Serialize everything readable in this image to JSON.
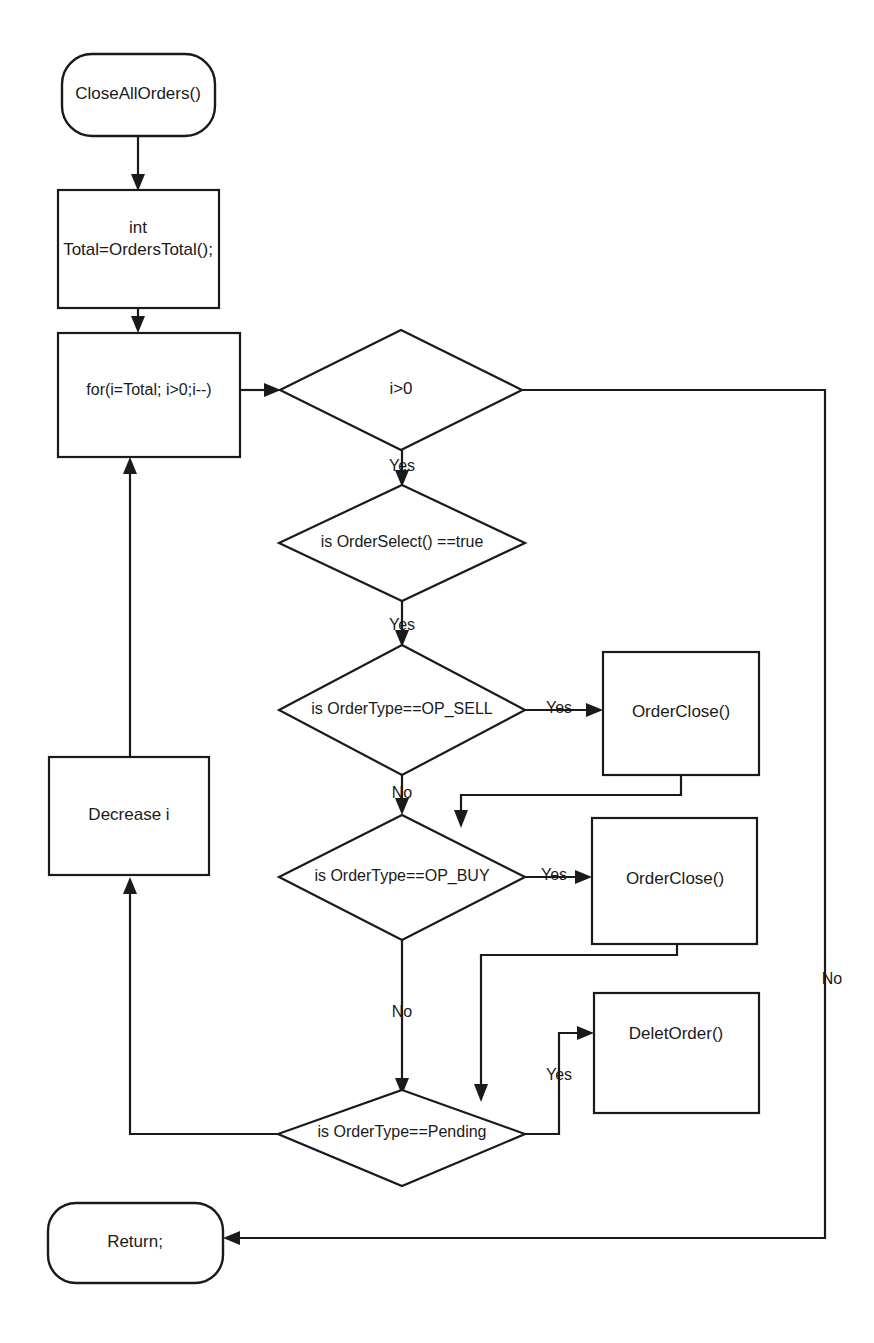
{
  "diagram": {
    "type": "flowchart",
    "background_color": "#ffffff",
    "line_color": "#1a1a1a",
    "text_color": "#1a1a1a"
  },
  "nodes": {
    "start": {
      "label": "CloseAllOrders()",
      "shape": "terminator"
    },
    "init_total": {
      "line1": "int",
      "line2": "Total=OrdersTotal();",
      "shape": "process"
    },
    "for_loop": {
      "label": "for(i=Total; i>0;i--)",
      "shape": "process"
    },
    "cond_i_gt_0": {
      "label": "i>0",
      "shape": "decision"
    },
    "cond_order_select": {
      "label": "is OrderSelect() ==true",
      "shape": "decision"
    },
    "cond_op_sell": {
      "label": "is OrderType==OP_SELL",
      "shape": "decision"
    },
    "cond_op_buy": {
      "label": "is OrderType==OP_BUY",
      "shape": "decision"
    },
    "cond_pending": {
      "label": "is OrderType==Pending",
      "shape": "decision"
    },
    "order_close_sell": {
      "label": "OrderClose()",
      "shape": "process"
    },
    "order_close_buy": {
      "label": "OrderClose()",
      "shape": "process"
    },
    "delete_order": {
      "label": "DeletOrder()",
      "shape": "process"
    },
    "decrease_i": {
      "label": "Decrease i",
      "shape": "process"
    },
    "end_return": {
      "label": "Return;",
      "shape": "terminator"
    }
  },
  "edge_labels": {
    "i_gt_0_yes": "Yes",
    "i_gt_0_no": "No",
    "order_select_yes": "Yes",
    "op_sell_yes": "Yes",
    "op_sell_no": "No",
    "op_buy_yes": "Yes",
    "op_buy_no": "No",
    "pending_yes": "Yes"
  }
}
